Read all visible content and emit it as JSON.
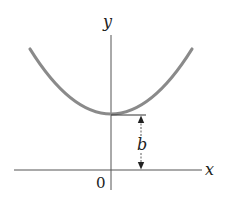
{
  "diagram": {
    "type": "parabola-graph",
    "axes": {
      "x_label": "x",
      "y_label": "y",
      "origin_label": "0"
    },
    "curve": {
      "description": "upward-opening parabola with vertex on the y-axis",
      "color": "#8a8a8a"
    },
    "annotation": {
      "label": "b",
      "description": "vertical distance from x-axis to the vertex of the curve"
    },
    "colors": {
      "axis": "#555555",
      "text": "#222222",
      "curve": "#8a8a8a"
    }
  }
}
